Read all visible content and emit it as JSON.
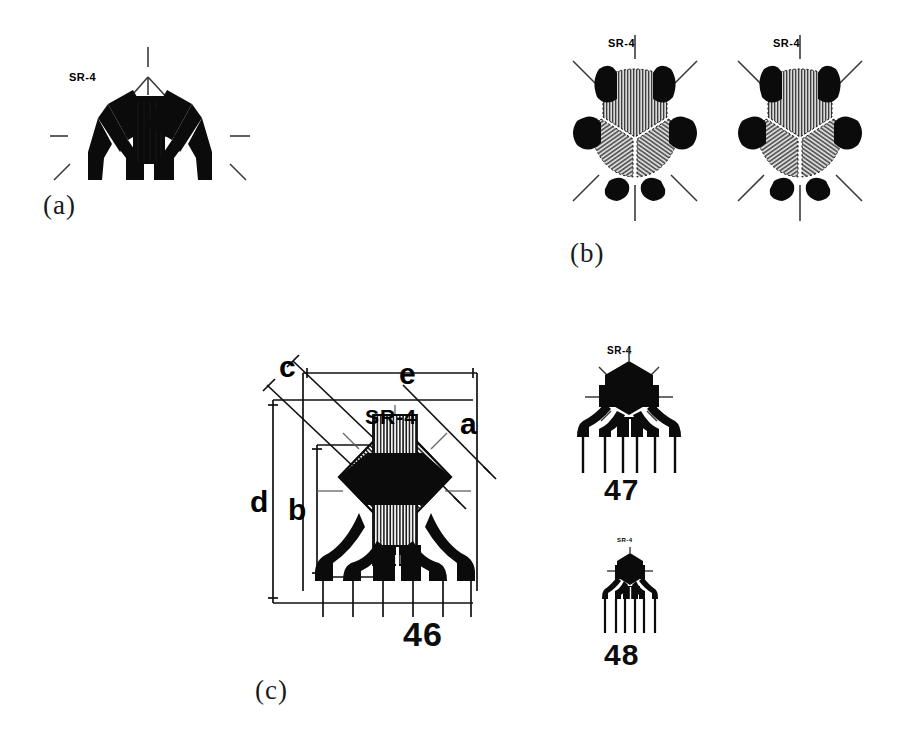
{
  "figure": {
    "background_color": "#ffffff",
    "ink_color": "#000000",
    "hatch_gray": "#8a8a8a"
  },
  "panels": [
    {
      "id": "a",
      "label": "(a)",
      "brand": "SR-4",
      "description": "three-element rectangular rosette, two angled gauges flanking one vertical gauge"
    },
    {
      "id": "b",
      "label": "(b)",
      "brand_left": "SR-4",
      "brand_right": "SR-4",
      "description": "two 60-degree delta rosettes with hatched grid sectors"
    },
    {
      "id": "c",
      "label": "(c)",
      "brand_main": "SR-4",
      "brand_47": "SR-4",
      "brand_48": "SR-4",
      "description": "dimensioned stacked rosette with lettered dimensions and two smaller variants"
    }
  ],
  "dimensions": {
    "letters": [
      "a",
      "b",
      "c",
      "d",
      "e"
    ],
    "a": "a",
    "b": "b",
    "c": "c",
    "d": "d",
    "e": "e"
  },
  "part_numbers": {
    "main": "46",
    "medium": "47",
    "small": "48"
  }
}
